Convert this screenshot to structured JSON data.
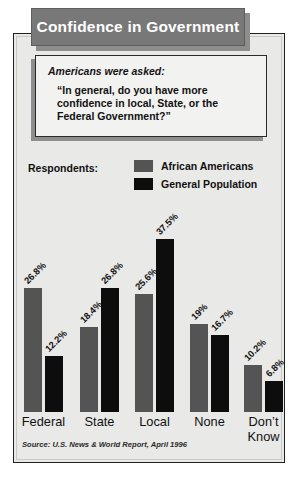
{
  "title": "Confidence in Government",
  "question": {
    "intro": "Americans were asked:",
    "text": "“In general, do you have more confidence in local, State, or the Federal Government?”"
  },
  "legend": {
    "label": "Respondents:",
    "items": [
      {
        "name": "African Americans",
        "color": "#545454"
      },
      {
        "name": "General Population",
        "color": "#0d0d0d"
      }
    ]
  },
  "source": "Source: U.S. News & World Report, April 1996",
  "chart_data": {
    "type": "bar",
    "title": "Confidence in Government",
    "xlabel": "",
    "ylabel": "",
    "ylim": [
      0,
      40
    ],
    "grid": false,
    "legend_position": "top",
    "categories": [
      "Federal",
      "State",
      "Local",
      "None",
      "Don’t Know"
    ],
    "series": [
      {
        "name": "African Americans",
        "color": "#545454",
        "values": [
          26.8,
          18.4,
          25.6,
          19.0,
          10.2
        ],
        "labels": [
          "26.8%",
          "18.4%",
          "25.6%",
          "19%",
          "10.2%"
        ]
      },
      {
        "name": "General Population",
        "color": "#0d0d0d",
        "values": [
          12.2,
          26.8,
          37.5,
          16.7,
          6.8
        ],
        "labels": [
          "12.2%",
          "26.8%",
          "37.5%",
          "16.7%",
          "6.8%"
        ]
      }
    ]
  }
}
